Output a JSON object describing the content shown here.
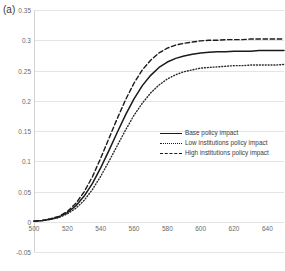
{
  "panel": {
    "label": "(a)"
  },
  "chart_data": {
    "type": "line",
    "title": "",
    "xlabel": "",
    "ylabel": "",
    "xlim": [
      500,
      650
    ],
    "ylim": [
      -0.05,
      0.35
    ],
    "grid": true,
    "legend_position": "center-right",
    "y_ticks": [
      "0.35",
      "0.3",
      "0.25",
      "0.2",
      "0.15",
      "0.1",
      "0.05",
      "0",
      "-0.05"
    ],
    "y_tick_values": [
      0.35,
      0.3,
      0.25,
      0.2,
      0.15,
      0.1,
      0.05,
      0,
      -0.05
    ],
    "x_ticks": [
      "500",
      "520",
      "540",
      "560",
      "580",
      "600",
      "620",
      "640"
    ],
    "x_tick_values": [
      500,
      520,
      540,
      560,
      580,
      600,
      620,
      640
    ],
    "x": [
      500,
      505,
      510,
      515,
      520,
      525,
      530,
      535,
      540,
      545,
      550,
      555,
      560,
      565,
      570,
      575,
      580,
      585,
      590,
      595,
      600,
      605,
      610,
      615,
      620,
      625,
      630,
      635,
      640,
      645,
      650
    ],
    "series": [
      {
        "name": "Base policy impact",
        "style": "solid",
        "color": "#1a1a1a",
        "values": [
          0.001,
          0.002,
          0.004,
          0.008,
          0.015,
          0.026,
          0.042,
          0.063,
          0.089,
          0.118,
          0.148,
          0.177,
          0.203,
          0.225,
          0.242,
          0.255,
          0.264,
          0.27,
          0.274,
          0.277,
          0.279,
          0.28,
          0.281,
          0.281,
          0.282,
          0.282,
          0.282,
          0.283,
          0.283,
          0.283,
          0.283
        ]
      },
      {
        "name": "Low institutions policy impact",
        "style": "dotted",
        "color": "#2a2a2a",
        "values": [
          0.001,
          0.002,
          0.004,
          0.007,
          0.013,
          0.022,
          0.035,
          0.053,
          0.075,
          0.1,
          0.126,
          0.152,
          0.176,
          0.196,
          0.213,
          0.226,
          0.236,
          0.243,
          0.248,
          0.251,
          0.254,
          0.255,
          0.256,
          0.257,
          0.258,
          0.258,
          0.259,
          0.259,
          0.259,
          0.259,
          0.26
        ]
      },
      {
        "name": "High institutions policy impact",
        "style": "dashed",
        "color": "#1a1a1a",
        "values": [
          0.001,
          0.002,
          0.005,
          0.009,
          0.017,
          0.03,
          0.049,
          0.074,
          0.105,
          0.138,
          0.171,
          0.202,
          0.229,
          0.251,
          0.267,
          0.279,
          0.287,
          0.292,
          0.295,
          0.297,
          0.299,
          0.3,
          0.3,
          0.301,
          0.301,
          0.301,
          0.302,
          0.302,
          0.302,
          0.302,
          0.302
        ]
      }
    ]
  }
}
